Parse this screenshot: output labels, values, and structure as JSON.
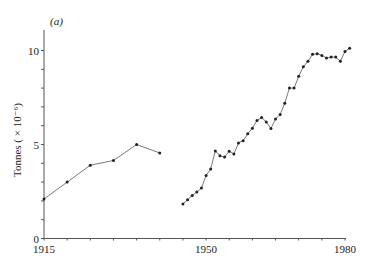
{
  "chart_data": {
    "type": "line",
    "title": "",
    "panel_label": "(a)",
    "xlabel": "",
    "ylabel": "Tonnes ( × 10⁻⁶)",
    "xlim": [
      1915,
      1980
    ],
    "ylim": [
      0,
      10
    ],
    "x_major_ticks": [
      1915,
      1950,
      1980
    ],
    "x_tick_labels": [
      "1915",
      "1950",
      "1980"
    ],
    "x_minor_tick_step": 5,
    "y_major_ticks": [
      0,
      5,
      10
    ],
    "y_tick_labels": [
      "0",
      "5",
      "10"
    ],
    "y_minor_tick_step": 1,
    "grid": false,
    "legend": "none",
    "series": [
      {
        "name": "1915-1940",
        "x": [
          1915,
          1920,
          1925,
          1930,
          1935,
          1940
        ],
        "values": [
          2.1,
          3.0,
          3.9,
          4.15,
          5.0,
          4.55
        ]
      },
      {
        "name": "1945-1981",
        "x": [
          1945,
          1946,
          1947,
          1948,
          1949,
          1950,
          1951,
          1952,
          1953,
          1954,
          1955,
          1956,
          1957,
          1958,
          1959,
          1960,
          1961,
          1962,
          1963,
          1964,
          1965,
          1966,
          1967,
          1968,
          1969,
          1970,
          1971,
          1972,
          1973,
          1974,
          1975,
          1976,
          1977,
          1978,
          1979,
          1980,
          1981
        ],
        "values": [
          1.84,
          2.06,
          2.29,
          2.47,
          2.68,
          3.35,
          3.7,
          4.66,
          4.4,
          4.33,
          4.64,
          4.5,
          5.08,
          5.2,
          5.57,
          5.87,
          6.28,
          6.43,
          6.2,
          5.85,
          6.35,
          6.6,
          7.2,
          8.0,
          8.0,
          8.63,
          9.13,
          9.43,
          9.8,
          9.83,
          9.74,
          9.6,
          9.65,
          9.65,
          9.43,
          9.95,
          10.12
        ]
      }
    ]
  }
}
